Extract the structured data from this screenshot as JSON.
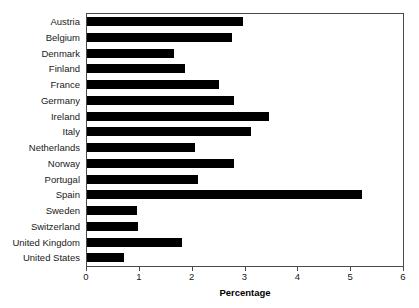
{
  "chart_data": {
    "type": "bar",
    "orientation": "horizontal",
    "title": "",
    "xlabel": "Percentage",
    "ylabel": "",
    "xlim": [
      0,
      6
    ],
    "xticks": [
      0,
      1,
      2,
      3,
      4,
      5,
      6
    ],
    "xtick_labels": [
      "0",
      "1",
      "2",
      "3",
      "4",
      "5",
      "6"
    ],
    "grid": false,
    "legend": null,
    "bar_color": "#000000",
    "frame_color": "#4a4a4a",
    "categories": [
      "Austria",
      "Belgium",
      "Denmark",
      "Finland",
      "France",
      "Germany",
      "Ireland",
      "Italy",
      "Netherlands",
      "Norway",
      "Portugal",
      "Spain",
      "Sweden",
      "Switzerland",
      "United Kingdom",
      "United States"
    ],
    "values": [
      2.95,
      2.75,
      1.65,
      1.85,
      2.5,
      2.78,
      3.45,
      3.1,
      2.05,
      2.78,
      2.1,
      5.2,
      0.95,
      0.96,
      1.8,
      0.7
    ]
  }
}
